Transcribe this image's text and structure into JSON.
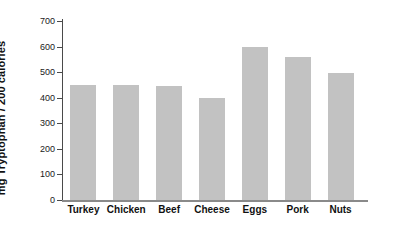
{
  "chart_data": {
    "type": "bar",
    "title": "",
    "xlabel": "",
    "ylabel": "mg Tryptophan / 200 calories",
    "categories": [
      "Turkey",
      "Chicken",
      "Beef",
      "Cheese",
      "Eggs",
      "Pork",
      "Nuts"
    ],
    "values": [
      450,
      450,
      447,
      397,
      598,
      558,
      495
    ],
    "ylim": [
      0,
      700
    ],
    "yticks": [
      0,
      100,
      200,
      300,
      400,
      500,
      600,
      700
    ],
    "ytick_labels": [
      "0",
      "100",
      "200",
      "300",
      "400",
      "500",
      "600",
      "700"
    ],
    "grid": false,
    "legend": null,
    "series": [
      {
        "name": "mg Tryptophan / 200 calories",
        "values": [
          450,
          450,
          447,
          397,
          598,
          558,
          495
        ]
      }
    ],
    "colors": {
      "bar_fill": "#c2c2c2",
      "axis": "#4a4a4a",
      "baseline": "#8a8a8a",
      "text": "#111111",
      "background": "#ffffff"
    }
  }
}
